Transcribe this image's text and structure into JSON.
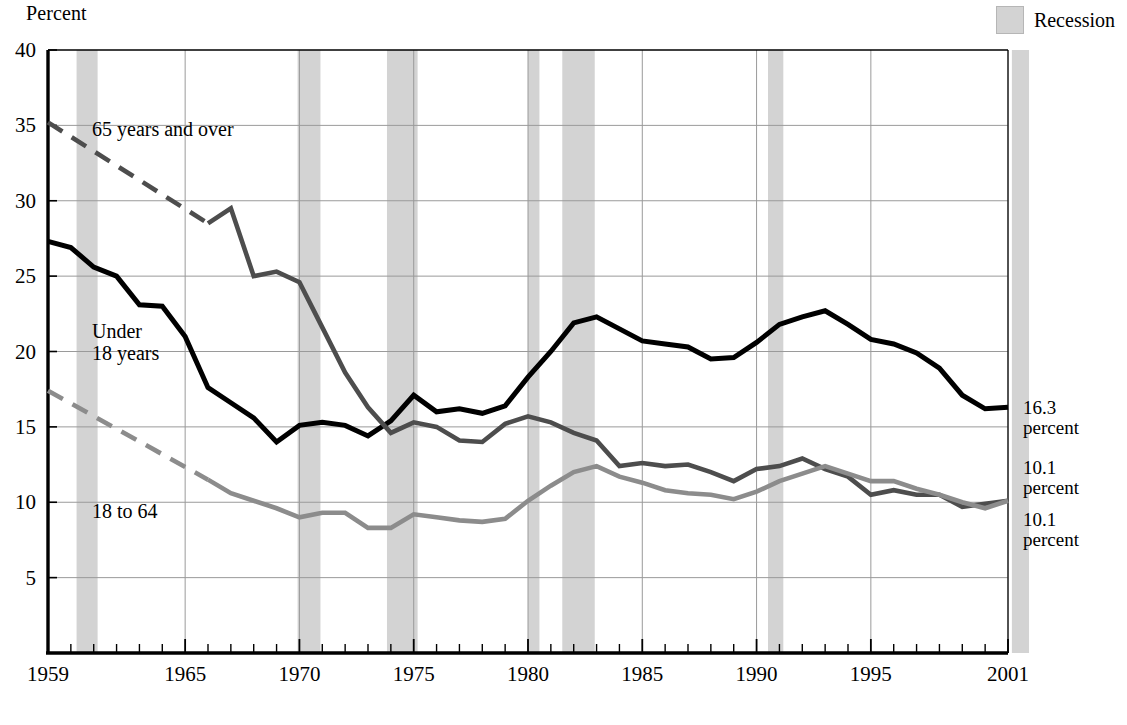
{
  "axis_title": "Percent",
  "legend": {
    "label": "Recession",
    "swatch_color": "#d3d3d3"
  },
  "series_annotations": [
    {
      "name": "65-and-over-label",
      "text": "65 years and over",
      "x": 92,
      "y": 118
    },
    {
      "name": "under-18-label",
      "line1": "Under",
      "line2": "18 years",
      "x": 92,
      "y": 320
    },
    {
      "name": "18-to-64-label",
      "text": "18 to 64",
      "x": 92,
      "y": 500
    }
  ],
  "end_labels": [
    {
      "value": "16.3",
      "unit": "percent",
      "y": 398,
      "series": "under-18"
    },
    {
      "value": "10.1",
      "unit": "percent",
      "y": 458,
      "series": "65-and-over"
    },
    {
      "value": "10.1",
      "unit": "percent",
      "y": 510,
      "series": "18-to-64"
    }
  ],
  "colors": {
    "under_18": "#000000",
    "over_65": "#4d4d4d",
    "age_18_64": "#8c8c8c",
    "recession_band": "#d3d3d3",
    "gridline": "#9a9a9a",
    "axis": "#000000"
  },
  "chart_data": {
    "type": "line",
    "title": "",
    "subtitle": "",
    "xlabel": "",
    "ylabel": "Percent",
    "xlim": [
      1959,
      2001
    ],
    "ylim": [
      0,
      40
    ],
    "yticks": [
      5,
      10,
      15,
      20,
      25,
      30,
      35,
      40
    ],
    "xticks": [
      1959,
      1965,
      1970,
      1975,
      1980,
      1985,
      1990,
      1995,
      2001
    ],
    "xtick_minor_step": 1,
    "grid": true,
    "legend_position": "top-right",
    "legend_entries": [
      "Recession"
    ],
    "x": [
      1959,
      1960,
      1961,
      1962,
      1963,
      1964,
      1965,
      1966,
      1967,
      1968,
      1969,
      1970,
      1971,
      1972,
      1973,
      1974,
      1975,
      1976,
      1977,
      1978,
      1979,
      1980,
      1981,
      1982,
      1983,
      1984,
      1985,
      1986,
      1987,
      1988,
      1989,
      1990,
      1991,
      1992,
      1993,
      1994,
      1995,
      1996,
      1997,
      1998,
      1999,
      2000,
      2001
    ],
    "series": [
      {
        "name": "Under 18 years",
        "color": "#000000",
        "style": "solid",
        "end_value": 16.3,
        "values": [
          27.3,
          26.9,
          25.6,
          25.0,
          23.1,
          23.0,
          21.0,
          17.6,
          16.6,
          15.6,
          14.0,
          15.1,
          15.3,
          15.1,
          14.4,
          15.4,
          17.1,
          16.0,
          16.2,
          15.9,
          16.4,
          18.3,
          20.0,
          21.9,
          22.3,
          21.5,
          20.7,
          20.5,
          20.3,
          19.5,
          19.6,
          20.6,
          21.8,
          22.3,
          22.7,
          21.8,
          20.8,
          20.5,
          19.9,
          18.9,
          17.1,
          16.2,
          16.3
        ]
      },
      {
        "name": "65 years and over",
        "color": "#4d4d4d",
        "style": "dashed-then-solid",
        "solid_from": 1966,
        "end_value": 10.1,
        "values": [
          35.2,
          null,
          null,
          null,
          null,
          null,
          null,
          28.5,
          29.5,
          25.0,
          25.3,
          24.6,
          21.6,
          18.6,
          16.3,
          14.6,
          15.3,
          15.0,
          14.1,
          14.0,
          15.2,
          15.7,
          15.3,
          14.6,
          14.1,
          12.4,
          12.6,
          12.4,
          12.5,
          12.0,
          11.4,
          12.2,
          12.4,
          12.9,
          12.2,
          11.7,
          10.5,
          10.8,
          10.5,
          10.5,
          9.7,
          9.9,
          10.1
        ]
      },
      {
        "name": "18 to 64",
        "color": "#8c8c8c",
        "style": "dashed-then-solid",
        "solid_from": 1966,
        "end_value": 10.1,
        "values": [
          17.4,
          null,
          null,
          null,
          null,
          null,
          null,
          11.5,
          10.6,
          10.1,
          9.6,
          9.0,
          9.3,
          9.3,
          8.3,
          8.3,
          9.2,
          9.0,
          8.8,
          8.7,
          8.9,
          10.1,
          11.1,
          12.0,
          12.4,
          11.7,
          11.3,
          10.8,
          10.6,
          10.5,
          10.2,
          10.7,
          11.4,
          11.9,
          12.4,
          11.9,
          11.4,
          11.4,
          10.9,
          10.5,
          10.0,
          9.6,
          10.1
        ]
      }
    ],
    "recession_bands": [
      {
        "start": 1960.25,
        "end": 1961.17
      },
      {
        "start": 1969.92,
        "end": 1970.92
      },
      {
        "start": 1973.83,
        "end": 1975.17
      },
      {
        "start": 1980.0,
        "end": 1980.5
      },
      {
        "start": 1981.5,
        "end": 1982.92
      },
      {
        "start": 1990.5,
        "end": 1991.17
      },
      {
        "start": 2001.17,
        "end": 2001.92
      }
    ]
  }
}
